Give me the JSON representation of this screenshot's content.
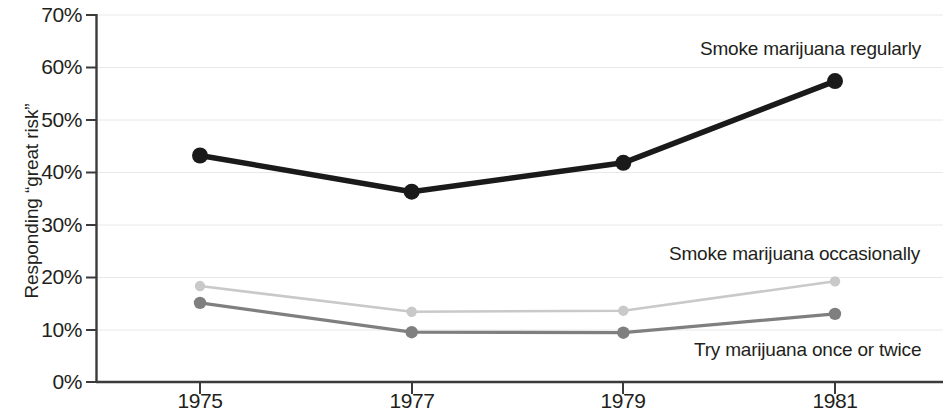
{
  "chart_data": {
    "type": "line",
    "title": "",
    "subtitle": "",
    "xlabel": "",
    "ylabel": "Responding “great risk”",
    "x": [
      1975,
      1977,
      1979,
      1981
    ],
    "categories": [
      "1975",
      "1977",
      "1979",
      "1981"
    ],
    "xtick_labels": [
      "1975",
      "1977",
      "1979",
      "1981"
    ],
    "ytick_labels": [
      "0%",
      "10%",
      "20%",
      "30%",
      "40%",
      "50%",
      "60%",
      "70%"
    ],
    "ytick_values": [
      0,
      10,
      20,
      30,
      40,
      50,
      60,
      70
    ],
    "ylim": [
      0,
      70
    ],
    "xlim": [
      1975,
      1981
    ],
    "grid": "horizontal-light",
    "legend_position": "inline-right",
    "markers": true,
    "series": [
      {
        "name": "Smoke marijuana regularly",
        "color": "#1a1a1a",
        "values": [
          43.2,
          36.3,
          41.8,
          57.4
        ],
        "label_text": "Smoke marijuana regularly"
      },
      {
        "name": "Smoke marijuana occasionally",
        "color": "#c9c9c9",
        "values": [
          18.3,
          13.4,
          13.6,
          19.2
        ],
        "label_text": "Smoke marijuana occasionally"
      },
      {
        "name": "Try marijuana once or twice",
        "color": "#7f7f7f",
        "values": [
          15.1,
          9.5,
          9.4,
          13.0
        ],
        "label_text": "Try marijuana once or twice"
      }
    ]
  },
  "axis": {
    "y_title": "Responding “great risk”",
    "y_ticks": [
      "70%",
      "60%",
      "50%",
      "40%",
      "30%",
      "20%",
      "10%",
      "0%"
    ],
    "x_ticks": [
      "1975",
      "1977",
      "1979",
      "1981"
    ]
  },
  "labels": {
    "regular": "Smoke marijuana regularly",
    "occasional": "Smoke marijuana occasionally",
    "try_once": "Try marijuana once or twice"
  },
  "colors": {
    "regular": "#1a1a1a",
    "occasional": "#c9c9c9",
    "try_once": "#7f7f7f",
    "axis": "#3b3b3b",
    "grid": "#e8e8ea",
    "text": "#231f20"
  }
}
